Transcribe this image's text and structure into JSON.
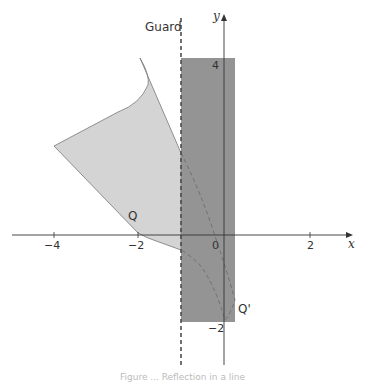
{
  "diagram": {
    "guard_label": "Guard",
    "axes": {
      "x_label": "x",
      "y_label": "y",
      "x_ticks": [
        {
          "value": -4,
          "label": "−4"
        },
        {
          "value": -2,
          "label": "−2"
        },
        {
          "value": 0,
          "label": "0"
        },
        {
          "value": 2,
          "label": "2"
        }
      ],
      "y_ticks": [
        {
          "value": 4,
          "label": "4"
        },
        {
          "value": -2,
          "label": "−2"
        }
      ]
    },
    "points": {
      "Q": "Q",
      "Q_prime": "Q'"
    },
    "colors": {
      "light_shape": "#d4d4d4",
      "dark_rectangle": "#8e8e8e",
      "outline": "#707070",
      "axis": "#333333"
    },
    "caption": "Figure ... Reflection in a line"
  }
}
